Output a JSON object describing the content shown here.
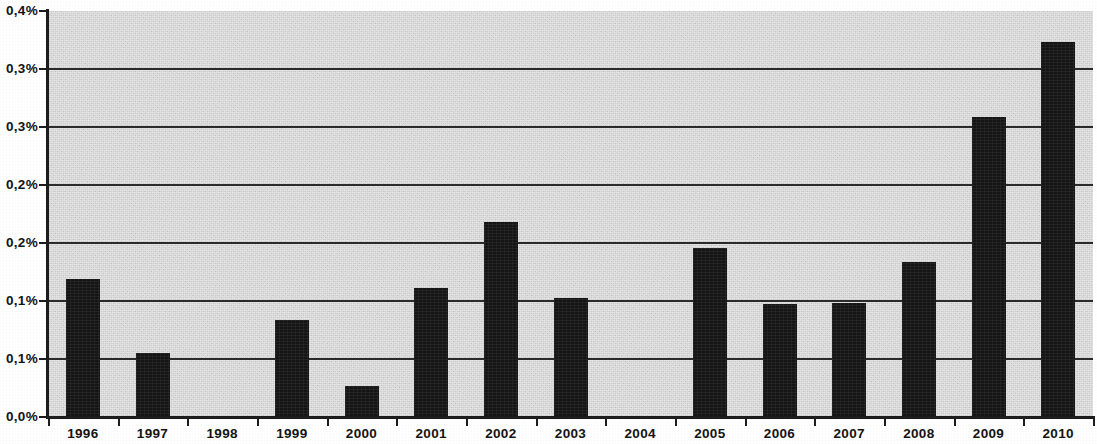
{
  "chart_data": {
    "type": "bar",
    "title": "",
    "subtitle": "",
    "xlabel": "",
    "ylabel": "",
    "categories": [
      "1996",
      "1997",
      "1998",
      "1999",
      "2000",
      "2001",
      "2002",
      "2003",
      "2004",
      "2005",
      "2006",
      "2007",
      "2008",
      "2009",
      "2010"
    ],
    "values": [
      0.119,
      0.055,
      0.0,
      0.084,
      0.027,
      0.111,
      0.168,
      0.103,
      0.0,
      0.146,
      0.097,
      0.098,
      0.134,
      0.259,
      0.323
    ],
    "value_unit": "%",
    "ylim": [
      0.0,
      0.35
    ],
    "ytick_values": [
      0.0,
      0.05,
      0.1,
      0.15,
      0.2,
      0.25,
      0.3,
      0.35
    ],
    "ytick_labels": [
      "0,0%",
      "0,1%",
      "0,1%",
      "0,2%",
      "0,2%",
      "0,3%",
      "0,3%",
      "0,4%"
    ],
    "grid": true,
    "grid_axis": "y",
    "legend": null,
    "legend_position": "none",
    "series": [
      {
        "name": "",
        "values": [
          0.119,
          0.055,
          0.0,
          0.084,
          0.027,
          0.111,
          0.168,
          0.103,
          0.0,
          0.146,
          0.097,
          0.098,
          0.134,
          0.259,
          0.323
        ]
      }
    ],
    "colors": {
      "bar": "#151515",
      "plot_background": "#d3d3d3",
      "gridline": "#2b2b2b",
      "axis": "#1d1d1d",
      "text": "#141414",
      "page_background": "#ffffff"
    }
  }
}
